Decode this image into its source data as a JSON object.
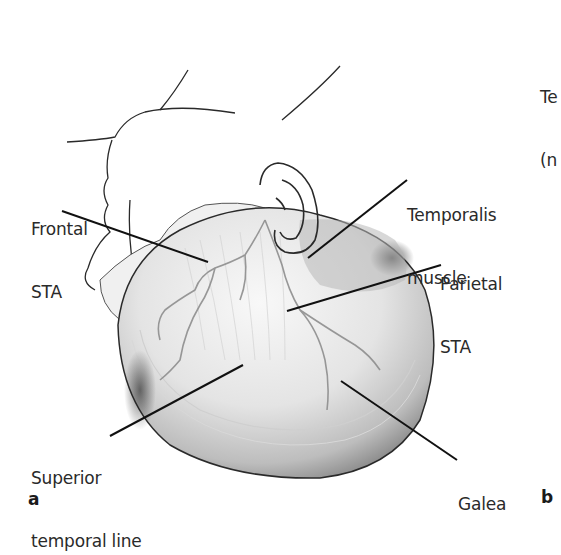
{
  "figure": {
    "panels": [
      {
        "letter": "a",
        "labels": {
          "frontal_sta": {
            "line1": "Frontal",
            "line2": "STA"
          },
          "temporalis_muscle": {
            "line1": "Temporalis",
            "line2": "muscle"
          },
          "parietal_sta": {
            "line1": "Parietal",
            "line2": "STA"
          },
          "superior_temporal_line": {
            "line1": "Superior",
            "line2": "temporal line"
          },
          "galea": {
            "line1": "Galea"
          }
        }
      },
      {
        "letter": "b",
        "partial_labels": {
          "line1": "Te",
          "line2": "(n"
        }
      }
    ],
    "colors": {
      "background": "#ffffff",
      "ink": "#1a1a1a",
      "text": "#2a2a2a",
      "galea_light": "#f2f2f2",
      "galea_shadow": "#8a8a8a",
      "vessel": "#9a9a9a"
    }
  }
}
